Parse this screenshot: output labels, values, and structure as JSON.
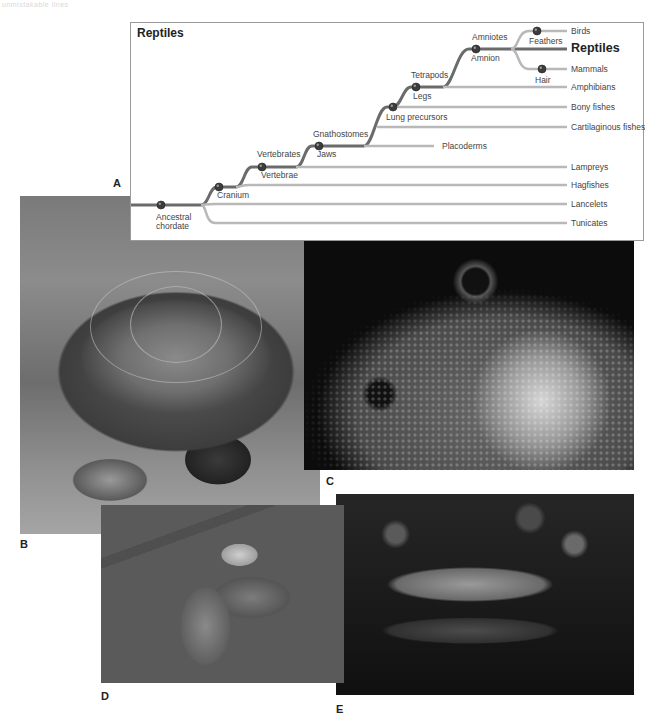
{
  "header_faint_text": "unmistakable lines",
  "panel_labels": {
    "a": "A",
    "b": "B",
    "c": "C",
    "d": "D",
    "e": "E"
  },
  "cladogram": {
    "title": "Reptiles",
    "line_colors": {
      "main_path": "#6b6b6b",
      "side_branch": "#b8b8b8",
      "node": "#3c3c3c"
    },
    "tips": [
      {
        "label": "Birds",
        "highlight": false
      },
      {
        "label": "Reptiles",
        "highlight": true
      },
      {
        "label": "Mammals",
        "highlight": false
      },
      {
        "label": "Amphibians",
        "highlight": false
      },
      {
        "label": "Bony fishes",
        "highlight": false
      },
      {
        "label": "Cartilaginous fishes",
        "highlight": false
      },
      {
        "label": "Placoderms",
        "highlight": false
      },
      {
        "label": "Lampreys",
        "highlight": false
      },
      {
        "label": "Hagfishes",
        "highlight": false
      },
      {
        "label": "Lancelets",
        "highlight": false
      },
      {
        "label": "Tunicates",
        "highlight": false
      }
    ],
    "nodes": [
      {
        "group": "",
        "trait": "Ancestral chordate"
      },
      {
        "group": "",
        "trait": "Cranium"
      },
      {
        "group": "Vertebrates",
        "trait": "Vertebrae"
      },
      {
        "group": "Gnathostomes",
        "trait": "Jaws"
      },
      {
        "group": "",
        "trait": "Lung precursors"
      },
      {
        "group": "Tetrapods",
        "trait": "Legs"
      },
      {
        "group": "Amniotes",
        "trait": "Amnion"
      },
      {
        "group": "",
        "trait": "Feathers"
      },
      {
        "group": "",
        "trait": "Hair"
      }
    ]
  },
  "photos": [
    {
      "id": "b",
      "subject": "Box turtle"
    },
    {
      "id": "c",
      "subject": "Iguana head close-up"
    },
    {
      "id": "d",
      "subject": "Coiled tree snake on branch"
    },
    {
      "id": "e",
      "subject": "Alligator in water"
    }
  ]
}
